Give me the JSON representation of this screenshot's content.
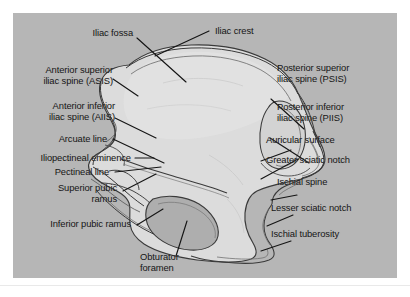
{
  "figure": {
    "panel_background_color": "#b6b6b6",
    "bone_fill_color": "#dcdcdc",
    "bone_shadow_color": "#c4c4c4",
    "foramen_fill_color": "#b0b0b0",
    "outline_color": "#3a3a3a",
    "leader_color": "#151515",
    "text_color": "#151515"
  },
  "labels_left": [
    {
      "id": "iliac-fossa",
      "text_lines": [
        "Iliac fossa"
      ]
    },
    {
      "id": "asis",
      "text_lines": [
        "Anterior superior",
        "iliac spine (ASIS)"
      ]
    },
    {
      "id": "aiis",
      "text_lines": [
        "Anterior inferior",
        "iliac spine (AIIS)"
      ]
    },
    {
      "id": "arcuate-line",
      "text_lines": [
        "Arcuate line"
      ]
    },
    {
      "id": "iliopectineal-eminence",
      "text_lines": [
        "Iliopectineal eminence"
      ]
    },
    {
      "id": "pectineal-line",
      "text_lines": [
        "Pectineal line"
      ]
    },
    {
      "id": "superior-pubic-ramus",
      "text_lines": [
        "Superior pubic",
        "ramus"
      ]
    },
    {
      "id": "inferior-pubic-ramus",
      "text_lines": [
        "Inferior pubic ramus"
      ]
    }
  ],
  "labels_right": [
    {
      "id": "iliac-crest",
      "text_lines": [
        "Iliac crest"
      ]
    },
    {
      "id": "psis",
      "text_lines": [
        "Posterior superior",
        "iliac spine (PSIS)"
      ]
    },
    {
      "id": "piis",
      "text_lines": [
        "Posterior inferior",
        "iliac spine (PIIS)"
      ]
    },
    {
      "id": "auricular-surface",
      "text_lines": [
        "Auricular surface"
      ]
    },
    {
      "id": "greater-sciatic-notch",
      "text_lines": [
        "Greater sciatic notch"
      ]
    },
    {
      "id": "ischial-spine",
      "text_lines": [
        "Ischial spine"
      ]
    },
    {
      "id": "lesser-sciatic-notch",
      "text_lines": [
        "Lesser sciatic notch"
      ]
    },
    {
      "id": "ischial-tuberosity",
      "text_lines": [
        "Ischial tuberosity"
      ]
    }
  ],
  "labels_bottom": [
    {
      "id": "obturator-foramen",
      "text_lines": [
        "Obturator",
        "foramen"
      ]
    }
  ],
  "text": {
    "iliac_fossa": "Iliac fossa",
    "asis_l1": "Anterior superior",
    "asis_l2": "iliac spine (ASIS)",
    "aiis_l1": "Anterior inferior",
    "aiis_l2": "iliac spine (AIIS)",
    "arcuate_line": "Arcuate line",
    "iliopectineal_eminence": "Iliopectineal eminence",
    "pectineal_line": "Pectineal line",
    "superior_pubic_ramus_l1": "Superior pubic",
    "superior_pubic_ramus_l2": "ramus",
    "inferior_pubic_ramus": "Inferior pubic ramus",
    "iliac_crest": "Iliac crest",
    "psis_l1": "Posterior superior",
    "psis_l2": "iliac spine (PSIS)",
    "piis_l1": "Posterior inferior",
    "piis_l2": "iliac spine (PIIS)",
    "auricular_surface": "Auricular surface",
    "greater_sciatic_notch": "Greater sciatic notch",
    "ischial_spine": "Ischial spine",
    "lesser_sciatic_notch": "Lesser sciatic notch",
    "ischial_tuberosity": "Ischial tuberosity",
    "obturator_foramen_l1": "Obturator",
    "obturator_foramen_l2": "foramen",
    "bottom_ghost": ""
  }
}
